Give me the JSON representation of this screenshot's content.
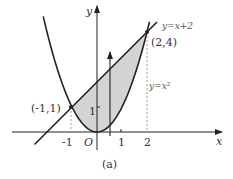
{
  "figure": {
    "caption": "(a)",
    "axes": {
      "x_label": "x",
      "y_label": "y",
      "origin_label": "O",
      "x_ticks": [
        "-1",
        "1",
        "2"
      ],
      "y_ticks": [
        "1"
      ]
    },
    "curves": [
      {
        "name": "line",
        "label": "y=x+2",
        "equation": "y = x + 2"
      },
      {
        "name": "parabola",
        "label": "y=x²",
        "equation": "y = x^2"
      }
    ],
    "points": [
      {
        "label": "(-1,1)",
        "x": -1,
        "y": 1
      },
      {
        "label": "(2,4)",
        "x": 2,
        "y": 4
      }
    ],
    "shaded_region": {
      "description": "Region between y=x+2 (above) and y=x^2 (below) for -1 ≤ x ≤ 2",
      "fill_color": "#d4d4d4"
    },
    "vertical_strip_arrow": {
      "x_approx": 0.5,
      "direction": "up"
    },
    "colors": {
      "curve": "#222222",
      "shade": "#d4d4d4",
      "text": "#333333",
      "dashed": "#888888"
    }
  }
}
